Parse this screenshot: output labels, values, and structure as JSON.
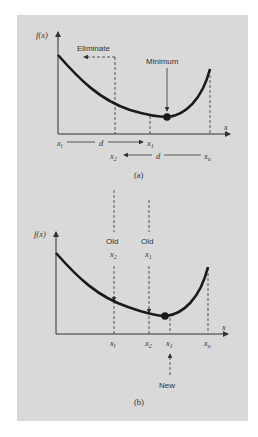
{
  "figure": {
    "panel_a": {
      "caption": "(a)",
      "y_axis_label": "f(x)",
      "x_axis_label": "x",
      "annotations": {
        "eliminate": "Eliminate",
        "minimum": "Minimum"
      },
      "row1": {
        "left": "x",
        "left_sub": "l",
        "middle": "d",
        "right": "x",
        "right_sub": "1"
      },
      "row2": {
        "left": "x",
        "left_sub": "2",
        "middle": "d",
        "right": "x",
        "right_sub": "u"
      }
    },
    "panel_b": {
      "caption": "(b)",
      "y_axis_label": "f(x)",
      "x_axis_label": "x",
      "old_labels": [
        {
          "word": "Old",
          "var": "x",
          "sub": "2"
        },
        {
          "word": "Old",
          "var": "x",
          "sub": "1"
        }
      ],
      "tick_labels": [
        {
          "var": "x",
          "sub": "l"
        },
        {
          "var": "x",
          "sub": "2"
        },
        {
          "var": "x",
          "sub": "1"
        },
        {
          "var": "x",
          "sub": "u"
        }
      ],
      "new_label": "New"
    },
    "colors": {
      "background": "#d9d9d9",
      "curve": "#1a1a1a",
      "axis": "#333333"
    }
  }
}
